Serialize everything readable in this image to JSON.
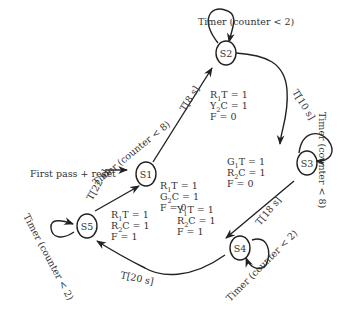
{
  "diagram": {
    "type": "state-machine",
    "colors": {
      "stroke": "#222222",
      "text": "#333333",
      "background": "#ffffff"
    },
    "entry": {
      "label": "First pass + reset",
      "target": "S1"
    },
    "states": [
      {
        "id": "S1",
        "label": "S1",
        "outputs": [
          "R1T = 1",
          "G2C = 1",
          "F = 0"
        ]
      },
      {
        "id": "S2",
        "label": "S2",
        "outputs": [
          "R1T = 1",
          "Y2C = 1",
          "F = 0"
        ]
      },
      {
        "id": "S3",
        "label": "S3",
        "outputs": [
          "G1T = 1",
          "R2C = 1",
          "F = 0"
        ]
      },
      {
        "id": "S4",
        "label": "S4",
        "outputs": [
          "Y1T = 1",
          "R2C = 1",
          "F = 1"
        ]
      },
      {
        "id": "S5",
        "label": "S5",
        "outputs": [
          "R1T = 1",
          "R2C = 1",
          "F = 1"
        ]
      }
    ],
    "transitions": [
      {
        "from": "S1",
        "to": "S2",
        "label": "T[8 s]"
      },
      {
        "from": "S2",
        "to": "S3",
        "label": "T[10 s]"
      },
      {
        "from": "S3",
        "to": "S4",
        "label": "T[18 s]"
      },
      {
        "from": "S4",
        "to": "S5",
        "label": "T[20 s]"
      },
      {
        "from": "S5",
        "to": "S1",
        "label": "T[22 s]"
      }
    ],
    "self_loops": [
      {
        "state": "S2",
        "label": "Timer (counter < 2)"
      },
      {
        "state": "S3",
        "label": "Timer (counter < 8)"
      },
      {
        "state": "S4",
        "label": "Timer (counter < 2)"
      },
      {
        "state": "S5",
        "label": "Timer (counter < 2)"
      }
    ],
    "free_labels": [
      {
        "near": "S1-S2",
        "label": "Timer (counter < 8)"
      }
    ]
  }
}
